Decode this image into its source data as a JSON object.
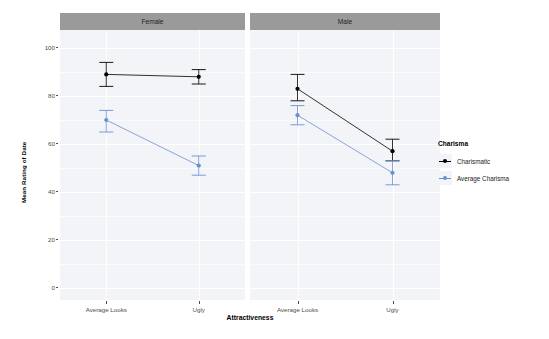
{
  "chart_data": {
    "type": "line",
    "title": "",
    "xlabel": "Attractiveness",
    "ylabel": "Mean Rating of Date",
    "categories": [
      "Average Looks",
      "Ugly"
    ],
    "ylim": [
      0,
      100
    ],
    "yticks": [
      0,
      20,
      40,
      60,
      80,
      100
    ],
    "grid": true,
    "legend_position": "right",
    "legend_title": "Charisma",
    "facets": [
      {
        "label": "Female",
        "series": [
          {
            "name": "Charismatic",
            "color": "#000000",
            "values": [
              89,
              88
            ],
            "err_low": [
              84,
              85
            ],
            "err_high": [
              94,
              91
            ]
          },
          {
            "name": "Average Charisma",
            "color": "#6B8FD4",
            "values": [
              70,
              51
            ],
            "err_low": [
              65,
              47
            ],
            "err_high": [
              74,
              55
            ]
          }
        ]
      },
      {
        "label": "Male",
        "series": [
          {
            "name": "Charismatic",
            "color": "#000000",
            "values": [
              83,
              57
            ],
            "err_low": [
              78,
              53
            ],
            "err_high": [
              89,
              62
            ]
          },
          {
            "name": "Average Charisma",
            "color": "#6B8FD4",
            "values": [
              72,
              48
            ],
            "err_low": [
              68,
              43
            ],
            "err_high": [
              76,
              53
            ]
          }
        ]
      }
    ]
  },
  "legend": {
    "title": "Charisma",
    "items": [
      {
        "label": "Charismatic",
        "color": "#000000"
      },
      {
        "label": "Average Charisma",
        "color": "#6B8FD4"
      }
    ]
  },
  "axes": {
    "ylabel": "Mean Rating of Date",
    "xlabel": "Attractiveness",
    "yticks": [
      "100",
      "80",
      "60",
      "40",
      "20",
      "0"
    ],
    "xticks": [
      "Average Looks",
      "Ugly"
    ]
  },
  "facet_labels": [
    "Female",
    "Male"
  ]
}
